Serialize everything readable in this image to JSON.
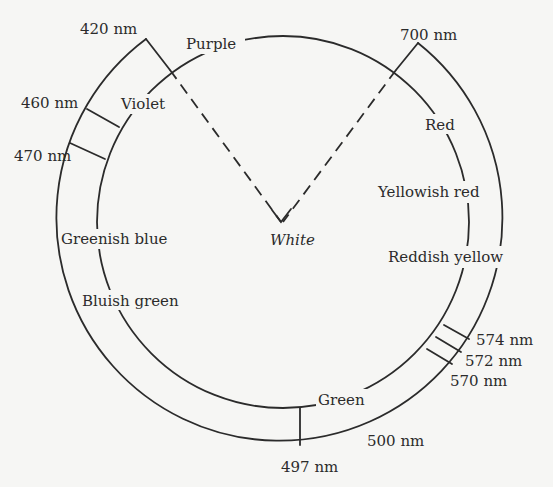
{
  "diagram": {
    "colors": {
      "background": "#f6f6f4",
      "ink": "#2b2b2b"
    },
    "hue_labels": {
      "purple": "Purple",
      "violet": "Violet",
      "greenish_blue": "Greenish blue",
      "bluish_green": "Bluish green",
      "green": "Green",
      "reddish_yellow": "Reddish yellow",
      "yellowish_red": "Yellowish red",
      "red": "Red",
      "white": "White"
    },
    "wavelength_labels": {
      "nm420": "420 nm",
      "nm460": "460 nm",
      "nm470": "470 nm",
      "nm497": "497 nm",
      "nm500": "500 nm",
      "nm570": "570 nm",
      "nm572": "572 nm",
      "nm574": "574 nm",
      "nm700": "700 nm"
    }
  }
}
